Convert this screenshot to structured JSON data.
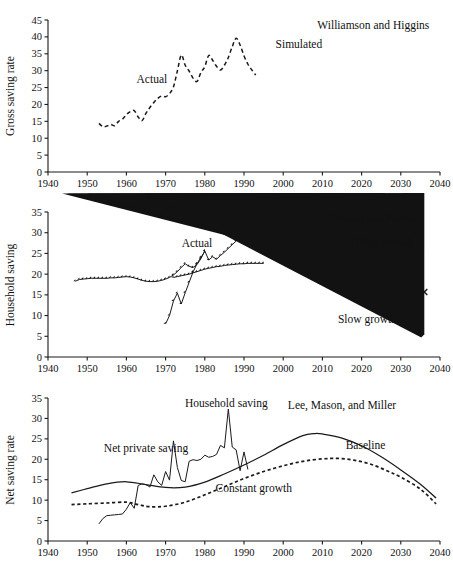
{
  "figure": {
    "title": "",
    "panels": [
      "gross_saving",
      "household_saving",
      "net_saving"
    ]
  },
  "chart_data": [
    {
      "id": "gross_saving",
      "type": "line",
      "title": "",
      "xlabel": "",
      "ylabel": "Gross saving rate",
      "xlim": [
        1940,
        2040
      ],
      "ylim": [
        0,
        45
      ],
      "xticks": [
        1940,
        1950,
        1960,
        1970,
        1980,
        1990,
        2000,
        2010,
        2020,
        2030,
        2040
      ],
      "yticks": [
        0,
        5,
        10,
        15,
        20,
        25,
        30,
        35,
        40,
        45
      ],
      "grid": false,
      "legend_position": "inline-annotations",
      "annotations": [
        {
          "text": "Actual",
          "x": 1966.5,
          "y": 26.3,
          "anchor": "middle"
        },
        {
          "text": "Simulated",
          "x": 2004.0,
          "y": 36.6,
          "anchor": "middle"
        },
        {
          "text": "Williamson and Higgins",
          "x": 2023.0,
          "y": 42.2,
          "anchor": "middle"
        }
      ],
      "series": [
        {
          "name": "Actual",
          "style": "dashed-line",
          "x": [
            1953,
            1954,
            1955,
            1956,
            1957,
            1958,
            1959,
            1960,
            1961,
            1962,
            1963,
            1964,
            1965,
            1966,
            1967,
            1968,
            1969,
            1970,
            1971,
            1972,
            1973,
            1974,
            1975,
            1976,
            1977,
            1978,
            1979,
            1980,
            1981,
            1982,
            1983,
            1984,
            1985,
            1986,
            1987,
            1988,
            1989,
            1990,
            1991,
            1992,
            1993
          ],
          "y": [
            14.4,
            13.4,
            13.6,
            14.1,
            13.7,
            15.0,
            15.6,
            17.0,
            17.9,
            18.2,
            16.3,
            15.2,
            17.4,
            19.1,
            20.6,
            21.8,
            22.5,
            22.3,
            23.2,
            25.2,
            29.9,
            34.6,
            31.6,
            29.9,
            27.8,
            26.8,
            29.4,
            31.2,
            34.5,
            33.1,
            31.3,
            30.2,
            31.6,
            33.9,
            37.1,
            39.6,
            37.6,
            34.4,
            31.9,
            30.2,
            28.7
          ]
        },
        {
          "name": "Simulated (Williamson and Higgins)",
          "style": "filled-diamond",
          "x": [
            1957,
            1962,
            1967,
            1972,
            1977,
            1982,
            1987,
            1991,
            2005,
            2015,
            2025
          ],
          "y": [
            11.2,
            12.5,
            17.0,
            22.5,
            26.7,
            30.0,
            33.9,
            36.8,
            42.4,
            40.2,
            33.5
          ]
        }
      ]
    },
    {
      "id": "household_saving",
      "type": "line",
      "title": "",
      "xlabel": "",
      "ylabel": "Household saving",
      "xlim": [
        1940,
        2040
      ],
      "ylim": [
        0,
        35
      ],
      "xticks": [
        1940,
        1950,
        1960,
        1970,
        1980,
        1990,
        2000,
        2010,
        2020,
        2030,
        2040
      ],
      "yticks": [
        0,
        5,
        10,
        15,
        20,
        25,
        30,
        35
      ],
      "grid": false,
      "legend_position": "inline-annotations",
      "annotations": [
        {
          "text": "Actual",
          "x": 1978.0,
          "y": 26.5,
          "anchor": "middle"
        },
        {
          "text": "Deaton and Paxson",
          "x": 2023.5,
          "y": 32.6,
          "anchor": "middle"
        },
        {
          "text": "High growth",
          "x": 2026.0,
          "y": 26.8,
          "anchor": "middle"
        },
        {
          "text": "Slow growth",
          "x": 2021.5,
          "y": 8.1,
          "anchor": "middle"
        }
      ],
      "series": [
        {
          "name": "Simulated series A (upper, rising)",
          "style": "filled-diamond-line",
          "x": [
            1947,
            1948,
            1949,
            1950,
            1951,
            1952,
            1953,
            1954,
            1955,
            1956,
            1957,
            1958,
            1959,
            1960,
            1961,
            1962,
            1963,
            1964,
            1965,
            1966,
            1967,
            1968,
            1969,
            1970,
            1971,
            1972,
            1973,
            1974,
            1975,
            1976,
            1977,
            1978,
            1979,
            1980,
            1981,
            1982,
            1983,
            1984,
            1985,
            1986,
            1987,
            1988,
            1989,
            1990,
            1991,
            1992,
            1993
          ],
          "y": [
            18.3,
            18.7,
            18.8,
            18.9,
            19.0,
            19.0,
            19.0,
            19.0,
            19.0,
            19.1,
            19.1,
            19.2,
            19.3,
            19.4,
            19.3,
            19.1,
            18.8,
            18.5,
            18.3,
            18.2,
            18.2,
            18.3,
            18.5,
            18.8,
            19.2,
            19.8,
            20.6,
            21.6,
            22.5,
            21.9,
            21.6,
            22.3,
            23.7,
            25.6,
            23.4,
            24.2,
            23.6,
            24.5,
            25.3,
            26.2,
            27.1,
            28.0,
            29.0,
            29.8,
            30.3,
            30.7,
            30.9
          ]
        },
        {
          "name": "Simulated series B (flattening)",
          "style": "filled-diamond-line",
          "x": [
            1972,
            1973,
            1974,
            1975,
            1976,
            1977,
            1978,
            1979,
            1980,
            1981,
            1982,
            1983,
            1984,
            1985,
            1986,
            1987,
            1988,
            1989,
            1990,
            1991,
            1992,
            1993,
            1994,
            1995
          ],
          "y": [
            19.2,
            19.4,
            19.6,
            19.8,
            20.0,
            20.3,
            20.6,
            20.9,
            21.2,
            21.4,
            21.6,
            21.8,
            21.9,
            22.1,
            22.2,
            22.3,
            22.4,
            22.5,
            22.5,
            22.6,
            22.6,
            22.6,
            22.6,
            22.6
          ]
        },
        {
          "name": "Actual",
          "style": "filled-diamond-line-steep",
          "x": [
            1970,
            1971,
            1972,
            1973,
            1974,
            1975,
            1976,
            1977,
            1978,
            1979,
            1980
          ],
          "y": [
            8.0,
            10.0,
            13.5,
            15.4,
            12.8,
            15.5,
            18.0,
            20.5,
            22.5,
            24.0,
            25.5
          ]
        },
        {
          "name": "Actual (early isolated points)",
          "style": "filled-diamond",
          "x": [
            1963.5,
            1965.5,
            1968.0
          ],
          "y": [
            11.3,
            10.7,
            9.0
          ]
        },
        {
          "name": "High growth",
          "style": "cross-x",
          "x": [
            2006,
            2016,
            2026,
            2036
          ],
          "y": [
            24.9,
            23.8,
            21.7,
            15.7
          ]
        },
        {
          "name": "Slow growth",
          "style": "filled-triangle",
          "x": [
            2006,
            2016,
            2026,
            2036
          ],
          "y": [
            24.6,
            23.4,
            18.5,
            4.7
          ]
        }
      ]
    },
    {
      "id": "net_saving",
      "type": "line",
      "title": "",
      "xlabel": "",
      "ylabel": "Net saving rate",
      "xlim": [
        1940,
        2040
      ],
      "ylim": [
        0,
        35
      ],
      "xticks": [
        1940,
        1950,
        1960,
        1970,
        1980,
        1990,
        2000,
        2010,
        2020,
        2030,
        2040
      ],
      "yticks": [
        0,
        5,
        10,
        15,
        20,
        25,
        30,
        35
      ],
      "grid": false,
      "legend_position": "inline-annotations",
      "annotations": [
        {
          "text": "Net private saving",
          "x": 1965.0,
          "y": 21.8,
          "anchor": "middle"
        },
        {
          "text": "Household saving",
          "x": 1985.5,
          "y": 32.8,
          "anchor": "middle"
        },
        {
          "text": "Lee, Mason, and Miller",
          "x": 2015.0,
          "y": 32.2,
          "anchor": "middle"
        },
        {
          "text": "Baseline",
          "x": 2021.0,
          "y": 22.4,
          "anchor": "middle"
        },
        {
          "text": "Constant growth",
          "x": 1992.5,
          "y": 12.0,
          "anchor": "middle"
        }
      ],
      "series": [
        {
          "name": "Baseline",
          "style": "solid-line",
          "x": [
            1946,
            1950,
            1955,
            1960,
            1965,
            1970,
            1975,
            1980,
            1985,
            1990,
            1995,
            2000,
            2005,
            2008,
            2010,
            2015,
            2020,
            2025,
            2030,
            2035,
            2039
          ],
          "y": [
            11.8,
            12.8,
            14.0,
            14.5,
            13.8,
            13.1,
            13.2,
            14.4,
            16.4,
            18.6,
            21.0,
            23.6,
            25.8,
            26.3,
            26.2,
            25.2,
            23.3,
            20.6,
            17.4,
            13.9,
            10.5
          ]
        },
        {
          "name": "Constant growth",
          "style": "dotted-line",
          "x": [
            1946,
            1950,
            1955,
            1960,
            1963,
            1966,
            1970,
            1975,
            1980,
            1985,
            1990,
            1995,
            2000,
            2005,
            2010,
            2014,
            2018,
            2022,
            2026,
            2030,
            2035,
            2039
          ],
          "y": [
            8.9,
            9.1,
            9.3,
            9.5,
            8.9,
            8.4,
            8.5,
            9.5,
            11.3,
            13.3,
            15.3,
            17.0,
            18.4,
            19.5,
            20.1,
            20.2,
            19.8,
            18.9,
            17.4,
            15.6,
            12.7,
            9.1
          ]
        },
        {
          "name": "Net private saving",
          "style": "thin-jagged-line",
          "x": [
            1953,
            1954,
            1955,
            1956,
            1957,
            1958,
            1959,
            1960,
            1961,
            1962,
            1963,
            1964,
            1965,
            1966,
            1967,
            1968,
            1969,
            1970,
            1971,
            1972,
            1973,
            1974,
            1975,
            1976,
            1977,
            1978,
            1979,
            1980,
            1981,
            1982,
            1983,
            1984,
            1985,
            1986,
            1987,
            1988,
            1989,
            1990,
            1991
          ],
          "y": [
            4.2,
            5.5,
            6.2,
            6.3,
            6.4,
            6.5,
            6.6,
            7.8,
            9.4,
            8.0,
            13.6,
            14.0,
            13.8,
            13.2,
            16.2,
            14.5,
            13.6,
            17.0,
            14.9,
            24.5,
            18.0,
            14.8,
            14.5,
            19.5,
            19.9,
            19.7,
            20.0,
            21.0,
            20.5,
            20.7,
            21.2,
            23.4,
            22.8,
            32.3,
            23.0,
            22.3,
            17.2,
            21.8,
            17.5
          ]
        },
        {
          "name": "Household saving",
          "style": "filled-diamond",
          "x": [
            1964,
            1966,
            1968,
            1969,
            1970,
            1971,
            1972,
            1973,
            1974,
            1975,
            1976,
            1977,
            1978,
            1979,
            1980,
            1981,
            1982,
            1983,
            1984,
            1985,
            1986,
            1987,
            1988,
            1989,
            1990,
            1991,
            1992,
            1993
          ],
          "y": [
            11.3,
            10.7,
            9.0,
            9.2,
            8.0,
            9.4,
            13.3,
            15.2,
            13.0,
            14.6,
            18.0,
            20.5,
            21.6,
            22.0,
            22.3,
            24.6,
            22.6,
            23.2,
            23.5,
            23.7,
            24.3,
            25.3,
            27.3,
            28.2,
            29.2,
            29.8,
            30.5,
            31.0
          ]
        }
      ]
    }
  ]
}
